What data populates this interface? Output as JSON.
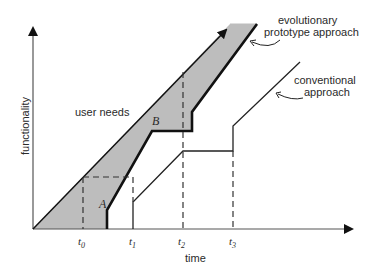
{
  "diagram": {
    "axes": {
      "x_label": "time",
      "y_label": "functionality",
      "ticks": [
        {
          "name": "t",
          "sub": "0"
        },
        {
          "name": "t",
          "sub": "1"
        },
        {
          "name": "t",
          "sub": "2"
        },
        {
          "name": "t",
          "sub": "3"
        }
      ]
    },
    "labels": {
      "user_needs": "user needs",
      "region_a": "A",
      "region_b": "B",
      "evolutionary_line1": "evolutionary",
      "evolutionary_line2": "prototype approach",
      "conventional_line1": "conventional",
      "conventional_line2": "approach"
    },
    "colors": {
      "band_fill": "#bdbdbd",
      "line": "#1a1a1a",
      "axis": "#555555"
    }
  }
}
